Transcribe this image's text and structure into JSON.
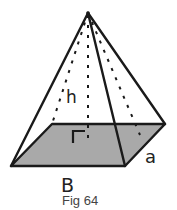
{
  "figure": {
    "caption": "Fig 64",
    "labels": {
      "height": "h",
      "base_length": "B",
      "base_width": "a"
    },
    "colors": {
      "base_fill": "#a9a9a9",
      "stroke": "#1a1a1a",
      "background": "#ffffff"
    },
    "shape": "rectangular pyramid",
    "right_angle_marker": true
  }
}
